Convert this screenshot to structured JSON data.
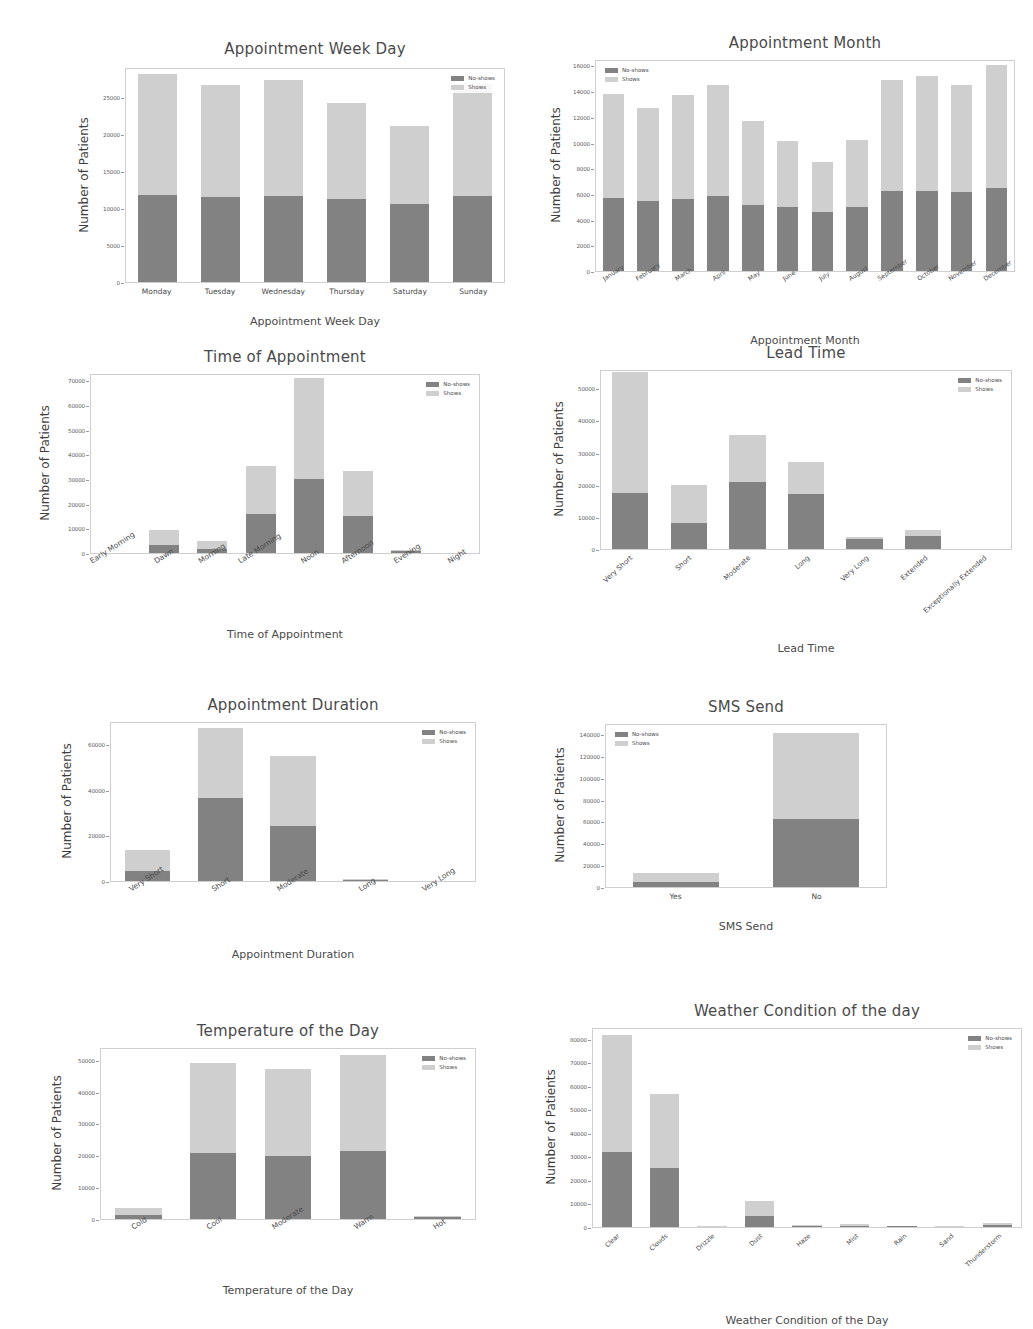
{
  "legend": {
    "noshows": "No-shows",
    "shows": "Shows"
  },
  "colors": {
    "noshows": "#828282",
    "shows": "#cfcfcf",
    "axis": "#cfcfcf",
    "text": "#4a4a4a"
  },
  "common": {
    "ylabel": "Number of Patients"
  },
  "caption": "",
  "chart_data": [
    {
      "id": "weekday",
      "type": "bar",
      "stacked": true,
      "title": "Appointment  Week Day",
      "xlabel": "Appointment Week Day",
      "ylabel": "Number of Patients",
      "categories": [
        "Monday",
        "Tuesday",
        "Wednesday",
        "Thursday",
        "Saturday",
        "Sunday"
      ],
      "yticks": [
        0,
        5000,
        10000,
        15000,
        20000,
        25000
      ],
      "ylim": [
        0,
        29000
      ],
      "grid": false,
      "legend_position": "upper right",
      "series": [
        {
          "name": "No-shows",
          "values": [
            11700,
            11500,
            11600,
            11200,
            10500,
            11600
          ]
        },
        {
          "name": "Shows",
          "values": [
            16300,
            15100,
            15600,
            13000,
            10600,
            15100
          ]
        }
      ],
      "totals": [
        28000,
        26600,
        27200,
        24200,
        21100,
        26700
      ]
    },
    {
      "id": "month",
      "type": "bar",
      "stacked": true,
      "title": "Appointment Month",
      "xlabel": "Appointment Month",
      "ylabel": "Number of Patients",
      "categories": [
        "January",
        "February",
        "March",
        "April",
        "May",
        "June",
        "July",
        "August",
        "September",
        "October",
        "November",
        "December"
      ],
      "yticks": [
        0,
        2000,
        4000,
        6000,
        8000,
        10000,
        12000,
        14000,
        16000
      ],
      "ylim": [
        0,
        16500
      ],
      "grid": false,
      "legend_position": "upper left",
      "series": [
        {
          "name": "No-shows",
          "values": [
            5700,
            5450,
            5600,
            5850,
            5150,
            4950,
            4600,
            5000,
            6200,
            6200,
            6150,
            6500
          ]
        },
        {
          "name": "Shows",
          "values": [
            8100,
            7200,
            8100,
            8600,
            6550,
            5150,
            3900,
            5200,
            8700,
            9000,
            8350,
            9500
          ]
        }
      ],
      "totals": [
        13800,
        12650,
        13700,
        14450,
        11700,
        10100,
        8500,
        10200,
        14900,
        15200,
        14500,
        16000
      ]
    },
    {
      "id": "time",
      "type": "bar",
      "stacked": true,
      "title": "Time of Appointment",
      "xlabel": "Time of Appointment",
      "ylabel": "Number of Patients",
      "categories": [
        "Early Morning",
        "Dawn",
        "Morning",
        "Late Morning",
        "Noon",
        "Afternoon",
        "Evening",
        "Night"
      ],
      "yticks": [
        0,
        10000,
        20000,
        30000,
        40000,
        50000,
        60000,
        70000
      ],
      "ylim": [
        0,
        73000
      ],
      "grid": false,
      "legend_position": "upper right",
      "series": [
        {
          "name": "No-shows",
          "values": [
            0,
            3200,
            1800,
            15800,
            30100,
            15000,
            700,
            0
          ]
        },
        {
          "name": "Shows",
          "values": [
            0,
            6000,
            3100,
            19500,
            40700,
            18200,
            600,
            0
          ]
        }
      ],
      "totals": [
        0,
        9200,
        4900,
        35300,
        70800,
        33200,
        1300,
        0
      ]
    },
    {
      "id": "lead",
      "type": "bar",
      "stacked": true,
      "title": "Lead Time",
      "xlabel": "Lead Time",
      "ylabel": "Number of Patients",
      "categories": [
        "Very Short",
        "Short",
        "Moderate",
        "Long",
        "Very Long",
        "Extended",
        "Exceptionally Extended"
      ],
      "yticks": [
        0,
        10000,
        20000,
        30000,
        40000,
        50000
      ],
      "ylim": [
        0,
        56000
      ],
      "grid": false,
      "legend_position": "upper right",
      "series": [
        {
          "name": "No-shows",
          "values": [
            17500,
            8000,
            21000,
            17000,
            3000,
            4000,
            0
          ]
        },
        {
          "name": "Shows",
          "values": [
            37500,
            12000,
            14500,
            10000,
            600,
            2000,
            0
          ]
        }
      ],
      "totals": [
        55000,
        20000,
        35500,
        27000,
        3600,
        6000,
        0
      ]
    },
    {
      "id": "duration",
      "type": "bar",
      "stacked": true,
      "title": "Appointment Duration",
      "xlabel": "Appointment Duration",
      "ylabel": "Number of Patients",
      "categories": [
        "Very Short",
        "Short",
        "Moderate",
        "Long",
        "Very Long"
      ],
      "yticks": [
        0,
        20000,
        40000,
        60000
      ],
      "ylim": [
        0,
        70000
      ],
      "grid": false,
      "legend_position": "upper right",
      "series": [
        {
          "name": "No-shows",
          "values": [
            4500,
            36500,
            24000,
            600,
            0
          ]
        },
        {
          "name": "Shows",
          "values": [
            9000,
            30500,
            30500,
            400,
            0
          ]
        }
      ],
      "totals": [
        13500,
        67000,
        54500,
        1000,
        0
      ]
    },
    {
      "id": "sms",
      "type": "bar",
      "stacked": true,
      "title": "SMS Send",
      "xlabel": "SMS Send",
      "ylabel": "Number of Patients",
      "categories": [
        "Yes",
        "No"
      ],
      "yticks": [
        0,
        20000,
        40000,
        60000,
        80000,
        100000,
        120000,
        140000
      ],
      "ylim": [
        0,
        150000
      ],
      "grid": false,
      "legend_position": "upper left",
      "series": [
        {
          "name": "No-shows",
          "values": [
            5000,
            62000
          ]
        },
        {
          "name": "Shows",
          "values": [
            8000,
            79000
          ]
        }
      ],
      "totals": [
        13000,
        141000
      ]
    },
    {
      "id": "temperature",
      "type": "bar",
      "stacked": true,
      "title": "Temperature of the Day",
      "xlabel": "Temperature of the Day",
      "ylabel": "Number of Patients",
      "categories": [
        "Cold",
        "Cool",
        "Moderate",
        "Warm",
        "Hot"
      ],
      "yticks": [
        0,
        10000,
        20000,
        30000,
        40000,
        50000
      ],
      "ylim": [
        0,
        54000
      ],
      "grid": false,
      "legend_position": "upper right",
      "series": [
        {
          "name": "No-shows",
          "values": [
            1400,
            20800,
            19800,
            21200,
            500
          ]
        },
        {
          "name": "Shows",
          "values": [
            2100,
            28200,
            27300,
            30300,
            400
          ]
        }
      ],
      "totals": [
        3500,
        49000,
        47100,
        51500,
        900
      ]
    },
    {
      "id": "weather",
      "type": "bar",
      "stacked": true,
      "title": "Weather Condition of the day",
      "xlabel": "Weather Condition of the Day",
      "ylabel": "Number of Patients",
      "categories": [
        "Clear",
        "Clouds",
        "Drizzle",
        "Dust",
        "Haze",
        "Mist",
        "Rain",
        "Sand",
        "Thunderstorm"
      ],
      "yticks": [
        0,
        10000,
        20000,
        30000,
        40000,
        50000,
        60000,
        70000,
        80000
      ],
      "ylim": [
        0,
        85000
      ],
      "grid": false,
      "legend_position": "upper right",
      "series": [
        {
          "name": "No-shows",
          "values": [
            32000,
            25000,
            200,
            4500,
            300,
            500,
            250,
            150,
            800
          ]
        },
        {
          "name": "Shows",
          "values": [
            49500,
            31500,
            250,
            6500,
            400,
            700,
            300,
            200,
            1000
          ]
        }
      ],
      "totals": [
        81500,
        56500,
        450,
        11000,
        700,
        1200,
        550,
        350,
        1800
      ]
    }
  ]
}
